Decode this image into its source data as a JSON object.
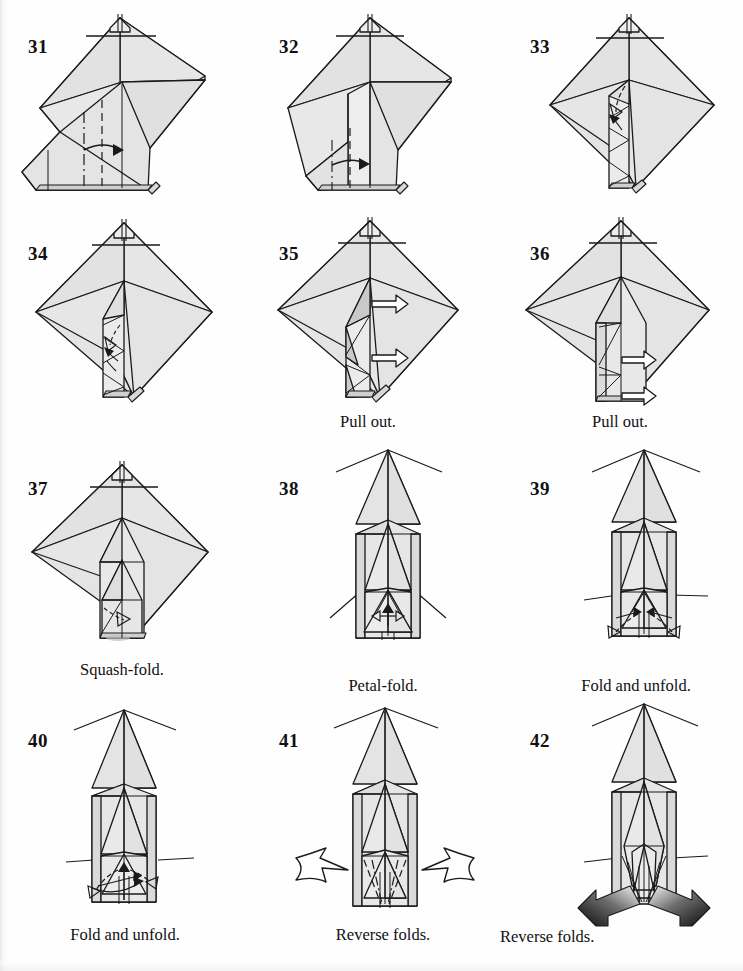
{
  "document": {
    "title": "Origami folding instructions, steps 31-42",
    "page_width": 743,
    "page_height": 971,
    "background_color": "#ffffff",
    "paper_fill": "#e4e4e4",
    "paper_fill_shade": "#d2d2d2",
    "paper_fill_light": "#ededed",
    "line_color": "#1a1a1a",
    "grid": {
      "columns": 3,
      "rows": 4
    }
  },
  "steps": [
    {
      "number": "31",
      "caption": "",
      "num_x": 28,
      "num_y": 36,
      "shape": "diamond-with-flap",
      "annotations": [
        "valley-fold-line",
        "mountain-fold-line",
        "fold-arrow-right"
      ]
    },
    {
      "number": "32",
      "caption": "",
      "num_x": 279,
      "num_y": 36,
      "shape": "diamond-with-raised-flap",
      "annotations": [
        "valley-fold-line",
        "mountain-fold-line",
        "fold-arrow-right"
      ]
    },
    {
      "number": "33",
      "caption": "",
      "num_x": 530,
      "num_y": 36,
      "shape": "diamond-narrow-column",
      "annotations": [
        "fold-arrow-down-left",
        "fold-arrow-up"
      ]
    },
    {
      "number": "34",
      "caption": "",
      "num_x": 28,
      "num_y": 243,
      "shape": "diamond-narrow-column",
      "annotations": [
        "fold-arrow-small"
      ]
    },
    {
      "number": "35",
      "caption": "Pull out.",
      "caption_x": 368,
      "caption_y": 412,
      "num_x": 279,
      "num_y": 243,
      "shape": "diamond-narrow-column-shaded",
      "annotations": [
        "pull-out-arrow-upper",
        "pull-out-arrow-lower"
      ]
    },
    {
      "number": "36",
      "caption": "Pull out.",
      "caption_x": 620,
      "caption_y": 412,
      "num_x": 530,
      "num_y": 243,
      "shape": "diamond-wide-column",
      "annotations": [
        "pull-out-arrow-upper",
        "pull-out-arrow-lower"
      ]
    },
    {
      "number": "37",
      "caption": "Squash-fold.",
      "caption_x": 122,
      "caption_y": 660,
      "num_x": 28,
      "num_y": 478,
      "shape": "diamond-wide-column-pointed",
      "annotations": [
        "squash-fold-arrow"
      ]
    },
    {
      "number": "38",
      "caption": "Petal-fold.",
      "caption_x": 383,
      "caption_y": 676,
      "num_x": 279,
      "num_y": 478,
      "shape": "tall-spire",
      "annotations": [
        "petal-fold-arrow"
      ]
    },
    {
      "number": "39",
      "caption": "Fold and unfold.",
      "caption_x": 636,
      "caption_y": 676,
      "num_x": 530,
      "num_y": 478,
      "shape": "tall-spire",
      "annotations": [
        "fold-unfold-arrow-left",
        "fold-unfold-arrow-right"
      ]
    },
    {
      "number": "40",
      "caption": "Fold and unfold.",
      "caption_x": 125,
      "caption_y": 925,
      "num_x": 28,
      "num_y": 730,
      "shape": "tall-spire",
      "annotations": [
        "fold-unfold-arrow-left",
        "fold-unfold-arrow-right",
        "rotate-arrow"
      ]
    },
    {
      "number": "41",
      "caption": "Reverse folds.",
      "caption_x": 383,
      "caption_y": 925,
      "num_x": 279,
      "num_y": 730,
      "shape": "tall-spire",
      "annotations": [
        "push-arrow-left",
        "push-arrow-right",
        "dashed-fold-lines"
      ]
    },
    {
      "number": "42",
      "caption": "Reverse folds.",
      "caption_x": 500,
      "caption_y": 927,
      "caption_align": "left",
      "num_x": 530,
      "num_y": 730,
      "shape": "tall-spire-narrowed",
      "annotations": [
        "gradient-push-arrow-left",
        "gradient-push-arrow-right"
      ]
    }
  ]
}
